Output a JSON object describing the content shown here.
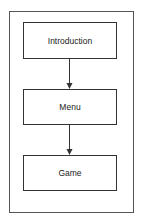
{
  "diagram": {
    "type": "flowchart",
    "nodes": [
      {
        "id": "introduction",
        "label": "Introduction"
      },
      {
        "id": "menu",
        "label": "Menu"
      },
      {
        "id": "game",
        "label": "Game"
      }
    ],
    "edges": [
      {
        "from": "introduction",
        "to": "menu"
      },
      {
        "from": "menu",
        "to": "game"
      }
    ]
  }
}
